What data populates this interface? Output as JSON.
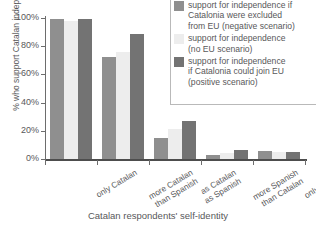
{
  "chart_data": {
    "type": "bar",
    "title": "",
    "xlabel": "Catalan respondents' self-identity",
    "ylabel": "% who support Catalan independence",
    "ylim": [
      0,
      100
    ],
    "ytick_labels": [
      "0%",
      "20%",
      "40%",
      "60%",
      "80%",
      "100%"
    ],
    "ytick_values": [
      0,
      20,
      40,
      60,
      80,
      100
    ],
    "grid": false,
    "legend_position": "top-right",
    "categories": [
      "only Catalan",
      "more Catalan than Spanish",
      "as Catalan as Spanish",
      "more Spanish than Catalan",
      "only Spanish"
    ],
    "category_lines": [
      [
        "only Catalan"
      ],
      [
        "more Catalan",
        "than Spanish"
      ],
      [
        "as Catalan",
        "as Spanish"
      ],
      [
        "more Spanish",
        "than Catalan"
      ],
      [
        "only Spanish"
      ]
    ],
    "series": [
      {
        "name": "support for independence if Catalonia were excluded from EU (negative scenario)",
        "color": "#8f8f8f",
        "values": [
          99,
          72,
          15,
          3,
          6
        ]
      },
      {
        "name": "support for independence (no EU scenario)",
        "color": "#ededed",
        "values": [
          98,
          76,
          21,
          4,
          5
        ]
      },
      {
        "name": "support for independence if Catalonia could join EU (positive scenario)",
        "color": "#737373",
        "values": [
          99,
          89,
          27,
          6.5,
          5
        ]
      }
    ]
  },
  "legend": {
    "items": [
      {
        "swatch": "s0",
        "lines": [
          "support for independence if",
          "Catalonia were excluded",
          "from EU (negative scenario)"
        ]
      },
      {
        "swatch": "s1",
        "lines": [
          "support for independence",
          "(no EU scenario)"
        ]
      },
      {
        "swatch": "s2",
        "lines": [
          "support for independence",
          "if Catalonia could join EU",
          "(positive scenario)"
        ]
      }
    ]
  },
  "colors": {
    "series_negative": "#8f8f8f",
    "series_no_eu": "#ededed",
    "series_positive": "#737373",
    "axis": "#6d6d6d",
    "text": "#58585a",
    "background": "#ffffff"
  }
}
